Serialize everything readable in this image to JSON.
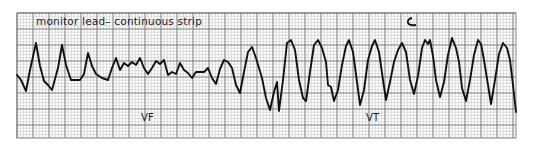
{
  "strip": {
    "title": "monitor lead– continuous strip",
    "segments": [
      {
        "label": "VF",
        "x_range_px": [
          17,
          270
        ]
      },
      {
        "label": "VT",
        "x_range_px": [
          270,
          516
        ]
      }
    ],
    "colors": {
      "paper": "#ffffff",
      "grid_minor": "#c8c8c8",
      "grid_major": "#6e6e6e",
      "trace": "#111111",
      "text": "#1a1a1a"
    },
    "grid": {
      "left": 17,
      "top": 13,
      "right": 516,
      "bottom": 138,
      "minor_px": 3.2,
      "major_px": 16
    },
    "trace_points": [
      [
        17,
        75
      ],
      [
        21,
        80
      ],
      [
        26,
        91
      ],
      [
        30,
        70
      ],
      [
        36,
        43
      ],
      [
        40,
        66
      ],
      [
        44,
        81
      ],
      [
        48,
        85
      ],
      [
        52,
        90
      ],
      [
        58,
        68
      ],
      [
        62,
        45
      ],
      [
        66,
        65
      ],
      [
        71,
        80
      ],
      [
        76,
        80
      ],
      [
        80,
        80
      ],
      [
        84,
        74
      ],
      [
        88,
        53
      ],
      [
        92,
        66
      ],
      [
        96,
        74
      ],
      [
        102,
        78
      ],
      [
        108,
        80
      ],
      [
        112,
        68
      ],
      [
        116,
        58
      ],
      [
        120,
        70
      ],
      [
        124,
        63
      ],
      [
        128,
        66
      ],
      [
        132,
        62
      ],
      [
        136,
        65
      ],
      [
        140,
        58
      ],
      [
        144,
        68
      ],
      [
        148,
        74
      ],
      [
        152,
        68
      ],
      [
        156,
        61
      ],
      [
        160,
        64
      ],
      [
        164,
        60
      ],
      [
        168,
        75
      ],
      [
        172,
        72
      ],
      [
        176,
        74
      ],
      [
        180,
        63
      ],
      [
        184,
        70
      ],
      [
        188,
        73
      ],
      [
        192,
        78
      ],
      [
        196,
        72
      ],
      [
        200,
        72
      ],
      [
        204,
        72
      ],
      [
        208,
        68
      ],
      [
        212,
        78
      ],
      [
        216,
        84
      ],
      [
        220,
        69
      ],
      [
        224,
        60
      ],
      [
        228,
        62
      ],
      [
        232,
        68
      ],
      [
        236,
        85
      ],
      [
        240,
        93
      ],
      [
        244,
        72
      ],
      [
        248,
        52
      ],
      [
        252,
        47
      ],
      [
        256,
        58
      ],
      [
        262,
        78
      ],
      [
        266,
        98
      ],
      [
        270,
        110
      ],
      [
        274,
        92
      ],
      [
        277,
        82
      ],
      [
        279,
        111
      ],
      [
        283,
        80
      ],
      [
        287,
        43
      ],
      [
        291,
        40
      ],
      [
        295,
        50
      ],
      [
        299,
        80
      ],
      [
        303,
        98
      ],
      [
        306,
        101
      ],
      [
        310,
        72
      ],
      [
        314,
        45
      ],
      [
        318,
        40
      ],
      [
        322,
        48
      ],
      [
        326,
        62
      ],
      [
        328,
        85
      ],
      [
        331,
        87
      ],
      [
        334,
        101
      ],
      [
        338,
        90
      ],
      [
        342,
        65
      ],
      [
        346,
        46
      ],
      [
        349,
        40
      ],
      [
        353,
        52
      ],
      [
        357,
        82
      ],
      [
        360,
        105
      ],
      [
        364,
        90
      ],
      [
        368,
        60
      ],
      [
        372,
        46
      ],
      [
        375,
        40
      ],
      [
        379,
        52
      ],
      [
        383,
        80
      ],
      [
        386,
        100
      ],
      [
        390,
        82
      ],
      [
        394,
        62
      ],
      [
        398,
        50
      ],
      [
        402,
        43
      ],
      [
        406,
        52
      ],
      [
        410,
        80
      ],
      [
        414,
        94
      ],
      [
        418,
        76
      ],
      [
        422,
        48
      ],
      [
        425,
        40
      ],
      [
        428,
        44
      ],
      [
        430,
        40
      ],
      [
        433,
        56
      ],
      [
        436,
        80
      ],
      [
        440,
        97
      ],
      [
        444,
        82
      ],
      [
        448,
        55
      ],
      [
        452,
        38
      ],
      [
        456,
        48
      ],
      [
        459,
        62
      ],
      [
        462,
        88
      ],
      [
        466,
        101
      ],
      [
        470,
        80
      ],
      [
        474,
        55
      ],
      [
        478,
        40
      ],
      [
        481,
        44
      ],
      [
        484,
        60
      ],
      [
        488,
        85
      ],
      [
        491,
        104
      ],
      [
        495,
        80
      ],
      [
        499,
        54
      ],
      [
        503,
        43
      ],
      [
        507,
        48
      ],
      [
        510,
        60
      ],
      [
        513,
        85
      ],
      [
        516,
        112
      ]
    ],
    "annotations": [
      {
        "type": "pen-mark-c",
        "x": 410,
        "y": 22
      }
    ]
  }
}
